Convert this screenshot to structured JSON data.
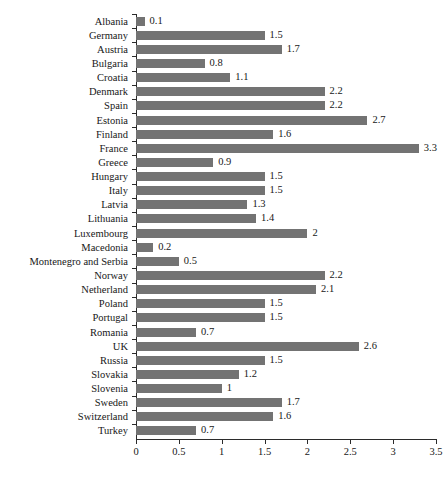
{
  "chart_data": {
    "type": "bar",
    "orientation": "horizontal",
    "title": "",
    "subtitle": "",
    "xlabel": "",
    "ylabel": "",
    "xlim": [
      0,
      3.5
    ],
    "xticks": [
      "0",
      "0.5",
      "1",
      "1.5",
      "2",
      "2.5",
      "3",
      "3.5"
    ],
    "xtick_values": [
      0,
      0.5,
      1,
      1.5,
      2,
      2.5,
      3,
      3.5
    ],
    "grid": false,
    "legend": null,
    "bar_color": "#737373",
    "axis_color": "#2b2b2b",
    "categories": [
      "Albania",
      "Germany",
      "Austria",
      "Bulgaria",
      "Croatia",
      "Denmark",
      "Spain",
      "Estonia",
      "Finland",
      "France",
      "Greece",
      "Hungary",
      "Italy",
      "Latvia",
      "Lithuania",
      "Luxembourg",
      "Macedonia",
      "Montenegro and Serbia",
      "Norway",
      "Netherland",
      "Poland",
      "Portugal",
      "Romania",
      "UK",
      "Russia",
      "Slovakia",
      "Slovenia",
      "Sweden",
      "Switzerland",
      "Turkey"
    ],
    "values": [
      0.1,
      1.5,
      1.7,
      0.8,
      1.1,
      2.2,
      2.2,
      2.7,
      1.6,
      3.3,
      0.9,
      1.5,
      1.5,
      1.3,
      1.4,
      2,
      0.2,
      0.5,
      2.2,
      2.1,
      1.5,
      1.5,
      0.7,
      2.6,
      1.5,
      1.2,
      1,
      1.7,
      1.6,
      0.7
    ],
    "value_labels": [
      "0.1",
      "1.5",
      "1.7",
      "0.8",
      "1.1",
      "2.2",
      "2.2",
      "2.7",
      "1.6",
      "3.3",
      "0.9",
      "1.5",
      "1.5",
      "1.3",
      "1.4",
      "2",
      "0.2",
      "0.5",
      "2.2",
      "2.1",
      "1.5",
      "1.5",
      "0.7",
      "2.6",
      "1.5",
      "1.2",
      "1",
      "1.7",
      "1.6",
      "0.7"
    ]
  },
  "caption": {
    "text": ""
  }
}
